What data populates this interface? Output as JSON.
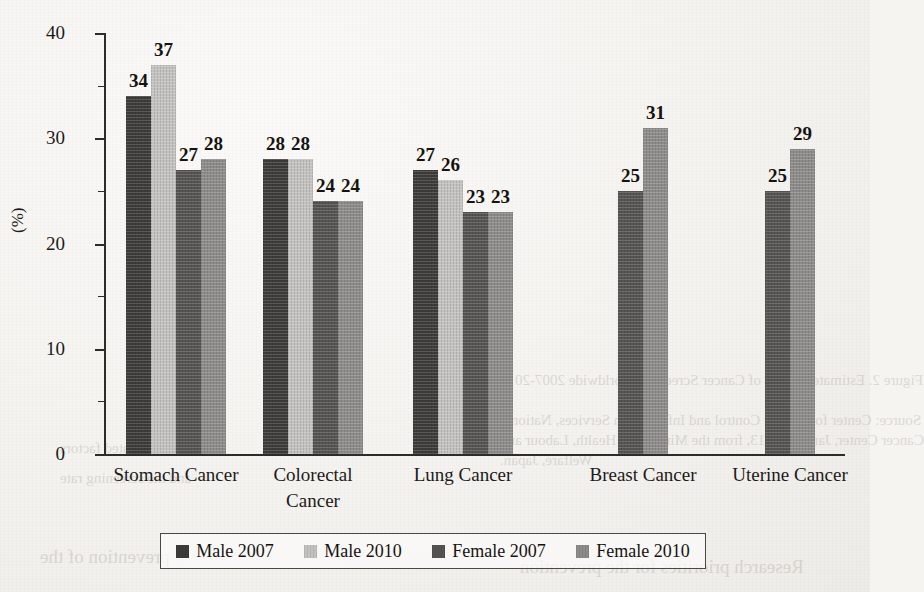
{
  "chart_data": {
    "type": "bar",
    "title": "",
    "xlabel": "",
    "ylabel": "(%)",
    "ylim": [
      0,
      40
    ],
    "yticks": [
      0,
      10,
      20,
      30,
      40
    ],
    "minor_ticks": [
      5,
      15,
      25,
      35
    ],
    "grid": false,
    "legend_position": "bottom",
    "categories": [
      "Stomach Cancer",
      "Colorectal Cancer",
      "Lung Cancer",
      "Breast Cancer",
      "Uterine Cancer"
    ],
    "series": [
      {
        "name": "Male 2007",
        "color": "#3e3c3a",
        "values": [
          34,
          28,
          27,
          null,
          null
        ]
      },
      {
        "name": "Male 2010",
        "color": "#c3c2c0",
        "values": [
          37,
          28,
          26,
          null,
          null
        ]
      },
      {
        "name": "Female 2007",
        "color": "#565452",
        "values": [
          27,
          24,
          23,
          25,
          25
        ]
      },
      {
        "name": "Female 2010",
        "color": "#8d8c8a",
        "values": [
          28,
          24,
          23,
          31,
          29
        ]
      }
    ]
  },
  "axis": {
    "y_tick_labels": [
      "40",
      "30",
      "20",
      "10",
      "0"
    ],
    "y_axis_title": "(%)"
  },
  "category_labels": [
    {
      "text": "Stomach Cancer",
      "lines": [
        "Stomach Cancer"
      ]
    },
    {
      "text": "Colorectal Cancer",
      "lines": [
        "Colorectal",
        "Cancer"
      ]
    },
    {
      "text": "Lung Cancer",
      "lines": [
        "Lung Cancer"
      ]
    },
    {
      "text": "Breast Cancer",
      "lines": [
        "Breast Cancer"
      ]
    },
    {
      "text": "Uterine Cancer",
      "lines": [
        "Uterine Cancer"
      ]
    }
  ],
  "legend": {
    "items": [
      {
        "label": "Male 2007",
        "color": "#3e3c3a"
      },
      {
        "label": "Male 2010",
        "color": "#c3c2c0"
      },
      {
        "label": "Female 2007",
        "color": "#565452"
      },
      {
        "label": "Female 2010",
        "color": "#8d8c8a"
      }
    ]
  },
  "background_bleed": [
    {
      "text": "Figure 2. Estimated Status of Cancer Screening Worldwide 2007-2010",
      "x": 500,
      "y": 372,
      "size": 15
    },
    {
      "text": "Source: Center for Cancer Control and Information Services, National",
      "x": 500,
      "y": 412,
      "size": 15
    },
    {
      "text": "Cancer Center, January 2013, from the Ministry of Health, Labour and",
      "x": 500,
      "y": 432,
      "size": 15
    },
    {
      "text": "Welfare, Japan.",
      "x": 500,
      "y": 452,
      "size": 15
    },
    {
      "text": "Research priorities for the prevention",
      "x": 520,
      "y": 556,
      "size": 19
    },
    {
      "text": "and the related factors",
      "x": 60,
      "y": 440,
      "size": 15
    },
    {
      "text": "and the screening rate",
      "x": 60,
      "y": 470,
      "size": 15
    },
    {
      "text": "prevention of the",
      "x": 40,
      "y": 546,
      "size": 19
    }
  ]
}
